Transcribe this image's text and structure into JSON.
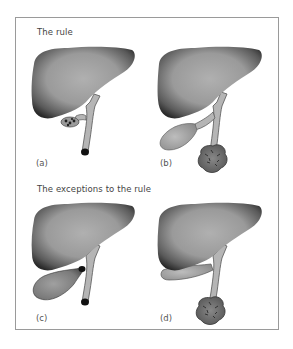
{
  "figure": {
    "sections": [
      {
        "heading": "The rule",
        "panels": [
          {
            "label": "(a)",
            "description": "Liver with small gallbladder containing stones; common bile duct obstructed by dark distal stone/tumour at lower end"
          },
          {
            "label": "(b)",
            "description": "Liver with distended gallbladder; mass (tumour) at lower end of common bile duct"
          }
        ]
      },
      {
        "heading": "The exceptions to the rule",
        "panels": [
          {
            "label": "(c)",
            "description": "Liver with distended gallbladder; stone impacted at cystic duct and at lower common bile duct"
          },
          {
            "label": "(d)",
            "description": "Liver with shrunken gallbladder; mass (tumour) at lower end of common bile duct"
          }
        ]
      }
    ],
    "colors": {
      "frame": "#9a9a9a",
      "liver_dark": "#2e2e2e",
      "liver_light": "#a8a8a8",
      "duct": "#b5b5b5",
      "stone": "#111111",
      "tumour": "#6e6e6e"
    }
  }
}
